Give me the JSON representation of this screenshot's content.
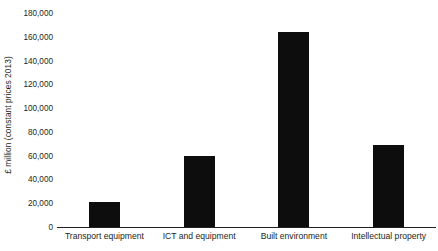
{
  "chart_data": {
    "type": "bar",
    "title": "",
    "subtitle": "",
    "xlabel": "",
    "ylabel": "£ million (constant prices 2013)",
    "categories": [
      "Transport equipment",
      "ICT and equipment",
      "Built environment",
      "Intellectual property"
    ],
    "values": [
      21000,
      59500,
      164000,
      69000
    ],
    "ylim": [
      0,
      180000
    ],
    "ytick_values": [
      0,
      20000,
      40000,
      60000,
      80000,
      100000,
      120000,
      140000,
      160000,
      180000
    ],
    "ytick_labels": [
      "0",
      "20,000",
      "40,000",
      "60,000",
      "80,000",
      "100,000",
      "120,000",
      "140,000",
      "160,000",
      "180,000"
    ],
    "grid": false,
    "legend": false,
    "legend_position": "none",
    "bar_color": "#0d0d0d",
    "axis_color": "#231f20",
    "background_color": "#ffffff"
  }
}
